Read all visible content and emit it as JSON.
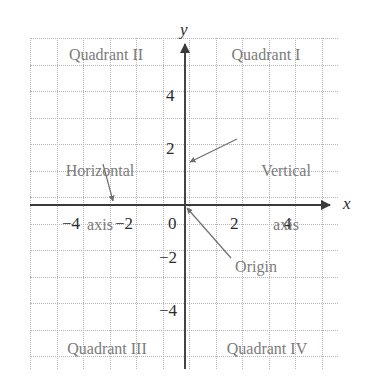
{
  "figure": {
    "type": "coordinate-plane-diagram",
    "width": 374,
    "height": 387,
    "background_color": "#ffffff",
    "grid_color": "#b5b5b5",
    "axis_color": "#3a3a3a",
    "label_color": "#7b7b7b",
    "tick_color": "#2b2b2b"
  },
  "axes": {
    "x_axis_name": "x",
    "y_axis_name": "y",
    "x_ticks": [
      {
        "label": "−4",
        "value": -4
      },
      {
        "label": "−2",
        "value": -2
      },
      {
        "label": "0",
        "value": 0
      },
      {
        "label": "2",
        "value": 2
      },
      {
        "label": "4",
        "value": 4
      }
    ],
    "y_ticks": [
      {
        "label": "4",
        "value": 4
      },
      {
        "label": "2",
        "value": 2
      },
      {
        "label": "−2",
        "value": -2
      },
      {
        "label": "−4",
        "value": -4
      }
    ]
  },
  "quadrants": {
    "q1": "Quadrant I",
    "q2": "Quadrant II",
    "q3": "Quadrant III",
    "q4": "Quadrant IV"
  },
  "annotations": {
    "horizontal_axis_line1": "Horizontal",
    "horizontal_axis_line2": "axis",
    "vertical_axis_line1": "Vertical",
    "vertical_axis_line2": "axis",
    "origin": "Origin"
  },
  "chart_data": {
    "type": "scatter",
    "title": "",
    "xlabel": "x",
    "ylabel": "y",
    "xlim": [
      -5.8,
      5.5
    ],
    "ylim": [
      -6.2,
      6.1
    ],
    "x_ticks": [
      -4,
      -2,
      0,
      2,
      4
    ],
    "y_ticks": [
      -4,
      -2,
      2,
      4
    ],
    "grid": true,
    "legend": null,
    "series": [],
    "annotations": [
      {
        "text": "Quadrant II",
        "x": -3.1,
        "y": 5.4
      },
      {
        "text": "Quadrant I",
        "x": 2.9,
        "y": 5.4
      },
      {
        "text": "Horizontal axis",
        "x": -3.1,
        "y": 2.3,
        "points_to": [
          -2.7,
          0
        ]
      },
      {
        "text": "Vertical axis",
        "x": 3.0,
        "y": 2.3,
        "points_to": [
          0.1,
          1.6
        ]
      },
      {
        "text": "Origin",
        "x": 2.4,
        "y": -2.6,
        "points_to": [
          0,
          0
        ]
      },
      {
        "text": "Quadrant III",
        "x": -3.1,
        "y": -5.6
      },
      {
        "text": "Quadrant IV",
        "x": 2.9,
        "y": -5.6
      }
    ]
  }
}
